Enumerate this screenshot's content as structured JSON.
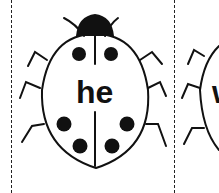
{
  "cards": [
    {
      "word": "he"
    },
    {
      "word": "w"
    }
  ],
  "colors": {
    "ink": "#111111",
    "paper": "#ffffff"
  }
}
